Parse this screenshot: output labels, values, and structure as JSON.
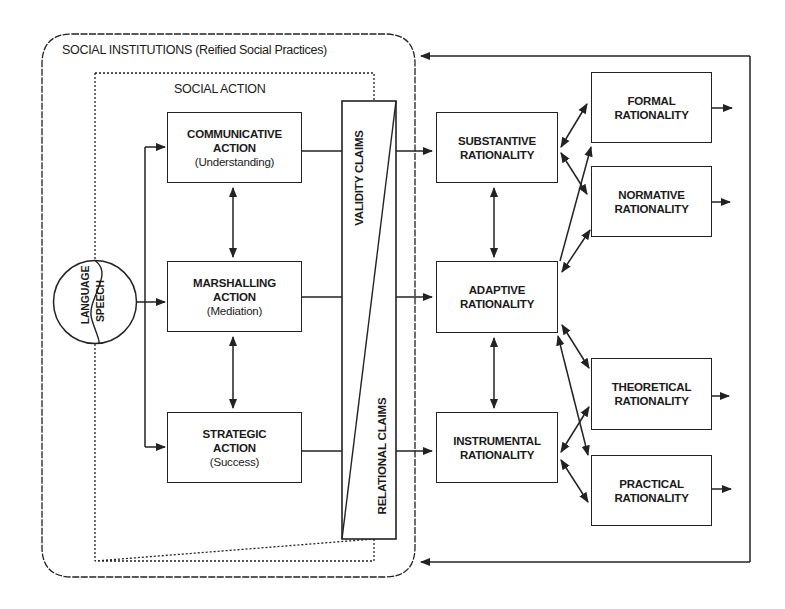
{
  "outer_frame": {
    "title": "SOCIAL INSTITUTIONS (Reified Social Practices)"
  },
  "inner_frame": {
    "title": "SOCIAL ACTION"
  },
  "source": {
    "left_label": "LANGUAGE",
    "right_label": "SPEECH"
  },
  "actions": [
    {
      "title_line1": "COMMUNICATIVE",
      "title_line2": "ACTION",
      "subtitle": "(Understanding)"
    },
    {
      "title_line1": "MARSHALLING",
      "title_line2": "ACTION",
      "subtitle": "(Mediation)"
    },
    {
      "title_line1": "STRATEGIC",
      "title_line2": "ACTION",
      "subtitle": "(Success)"
    }
  ],
  "claims": {
    "top_label": "VALIDITY CLAIMS",
    "bottom_label": "RELATIONAL CLAIMS"
  },
  "rationalities_middle": [
    {
      "line1": "SUBSTANTIVE",
      "line2": "RATIONALITY"
    },
    {
      "line1": "ADAPTIVE",
      "line2": "RATIONALITY"
    },
    {
      "line1": "INSTRUMENTAL",
      "line2": "RATIONALITY"
    }
  ],
  "rationalities_right": [
    {
      "line1": "FORMAL",
      "line2": "RATIONALITY"
    },
    {
      "line1": "NORMATIVE",
      "line2": "RATIONALITY"
    },
    {
      "line1": "THEORETICAL",
      "line2": "RATIONALITY"
    },
    {
      "line1": "PRACTICAL",
      "line2": "RATIONALITY"
    }
  ],
  "colors": {
    "line": "#222222",
    "background": "#ffffff"
  }
}
